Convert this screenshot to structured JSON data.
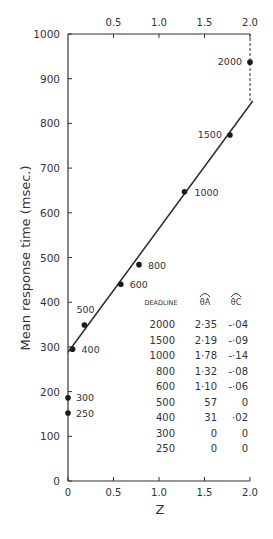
{
  "chart_data": {
    "type": "scatter",
    "title": "",
    "xlabel": "Z",
    "ylabel": "Mean response time (msec.)",
    "xlim": [
      0,
      2.0
    ],
    "ylim": [
      0,
      1000
    ],
    "x_ticks": [
      "0",
      "0.5",
      "1.0",
      "1.5",
      "2.0"
    ],
    "top_x_ticks": [
      "0.5",
      "1.0",
      "1.5",
      "2.0"
    ],
    "y_ticks": [
      "0",
      "100",
      "200",
      "300",
      "400",
      "500",
      "600",
      "700",
      "800",
      "900",
      "1000"
    ],
    "grid": false,
    "series": [
      {
        "name": "Deadline conditions",
        "points": [
          {
            "label": "2000",
            "x": 2.0,
            "y": 937
          },
          {
            "label": "1500",
            "x": 1.78,
            "y": 774
          },
          {
            "label": "1000",
            "x": 1.28,
            "y": 647
          },
          {
            "label": "800",
            "x": 0.78,
            "y": 484
          },
          {
            "label": "600",
            "x": 0.58,
            "y": 440
          },
          {
            "label": "500",
            "x": 0.18,
            "y": 349
          },
          {
            "label": "400",
            "x": 0.05,
            "y": 295
          },
          {
            "label": "300",
            "x": 0.0,
            "y": 186
          },
          {
            "label": "250",
            "x": 0.0,
            "y": 152
          }
        ]
      }
    ],
    "fit_line": {
      "x0": 0.0,
      "y0": 288,
      "x1": 2.03,
      "y1": 850
    },
    "dashed_connector": {
      "x": 2.0,
      "y_from": 850,
      "y_to": 1000
    },
    "table": {
      "headers": [
        "DEADLINE",
        "θA",
        "θC"
      ],
      "rows": [
        [
          "2000",
          "2·35",
          "-·04"
        ],
        [
          "1500",
          "2·19",
          "-·09"
        ],
        [
          "1000",
          "1·78",
          "-·14"
        ],
        [
          "800",
          "1·32",
          "-·08"
        ],
        [
          "600",
          "1·10",
          "-·06"
        ],
        [
          "500",
          "57",
          "0"
        ],
        [
          "400",
          "31",
          "·02"
        ],
        [
          "300",
          "0",
          "0"
        ],
        [
          "250",
          "0",
          "0"
        ]
      ]
    }
  }
}
